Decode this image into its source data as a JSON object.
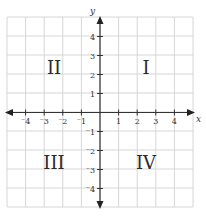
{
  "diagram": {
    "type": "coordinate-plane",
    "axes": {
      "x_label": "x",
      "y_label": "y",
      "x_ticks": [
        {
          "value": -4,
          "label": "⁻4"
        },
        {
          "value": -3,
          "label": "⁻3"
        },
        {
          "value": -2,
          "label": "⁻2"
        },
        {
          "value": -1,
          "label": "⁻1"
        },
        {
          "value": 1,
          "label": "1"
        },
        {
          "value": 2,
          "label": "2"
        },
        {
          "value": 3,
          "label": "3"
        },
        {
          "value": 4,
          "label": "4"
        }
      ],
      "y_ticks": [
        {
          "value": 4,
          "label": "4"
        },
        {
          "value": 3,
          "label": "3"
        },
        {
          "value": 2,
          "label": "2"
        },
        {
          "value": 1,
          "label": "1"
        },
        {
          "value": -1,
          "label": "⁻1"
        },
        {
          "value": -2,
          "label": "⁻2"
        },
        {
          "value": -3,
          "label": "⁻3"
        },
        {
          "value": -4,
          "label": "⁻4"
        }
      ]
    },
    "quadrants": [
      {
        "id": "I",
        "label": "I"
      },
      {
        "id": "II",
        "label": "II"
      },
      {
        "id": "III",
        "label": "III"
      },
      {
        "id": "IV",
        "label": "IV"
      }
    ],
    "colors": {
      "grid": "#d6d6d6",
      "axis": "#333333",
      "text": "#2a2a2a"
    }
  }
}
